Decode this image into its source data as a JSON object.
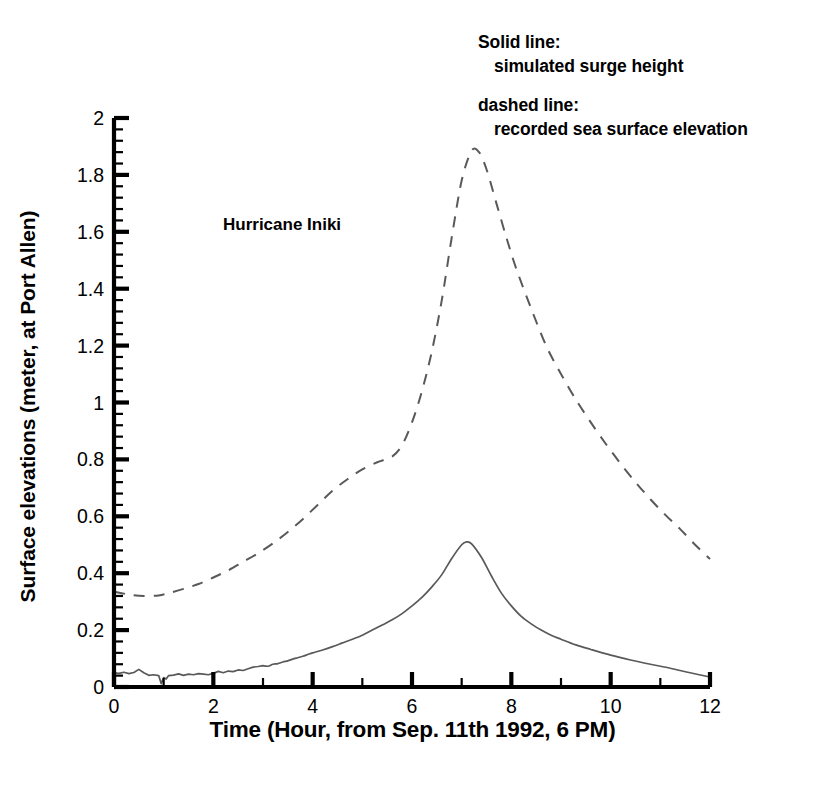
{
  "figure": {
    "width": 825,
    "height": 789,
    "background": "#ffffff",
    "ink_color": "#000000",
    "curve_color": "#59595b"
  },
  "annotations": {
    "solid_legend_line1": "Solid line:",
    "solid_legend_line2": "simulated surge height",
    "dashed_legend_line1": "dashed line:",
    "dashed_legend_line2": "recorded sea surface elevation",
    "storm_label": "Hurricane Iniki"
  },
  "axes": {
    "x_title": "Time (Hour, from Sep. 11th 1992, 6 PM)",
    "y_title": "Surface elevations (meter, at Port Allen)",
    "x_ticks_major": [
      0,
      2,
      4,
      6,
      8,
      10,
      12
    ],
    "x_tick_labels": [
      "0",
      "2",
      "4",
      "6",
      "8",
      "10",
      "12"
    ],
    "x_ticks_minor": [
      1,
      3,
      5,
      7,
      9,
      11
    ],
    "y_ticks_major": [
      0,
      0.2,
      0.4,
      0.6,
      0.8,
      1,
      1.2,
      1.4,
      1.6,
      1.8,
      2
    ],
    "y_tick_labels": [
      "0",
      "0.2",
      "0.4",
      "0.6",
      "0.8",
      "1",
      "1.2",
      "1.4",
      "1.6",
      "1.8",
      "2"
    ],
    "y_minor_step": 0.04,
    "xlim": [
      0,
      12
    ],
    "ylim": [
      0,
      2
    ],
    "grid": false,
    "spines": [
      "left",
      "bottom"
    ]
  },
  "chart_data": {
    "type": "line",
    "title": "",
    "xlabel": "Time (Hour, from Sep. 11th 1992, 6 PM)",
    "ylabel": "Surface elevations (meter, at Port Allen)",
    "xlim": [
      0,
      12
    ],
    "ylim": [
      0,
      2
    ],
    "grid": false,
    "legend_position": "annotation-top-right",
    "annotations": [
      "Hurricane Iniki",
      "Solid line: simulated surge height",
      "dashed line: recorded sea surface elevation"
    ],
    "series": [
      {
        "name": "simulated surge height",
        "style": "solid",
        "peak": {
          "x": 7.1,
          "y": 0.51
        },
        "x": [
          0.0,
          0.1,
          0.2,
          0.3,
          0.4,
          0.5,
          0.6,
          0.7,
          0.8,
          0.9,
          0.95,
          1.0,
          1.05,
          1.1,
          1.2,
          1.3,
          1.4,
          1.5,
          1.6,
          1.7,
          1.8,
          1.9,
          2.0,
          2.1,
          2.2,
          2.3,
          2.4,
          2.5,
          2.6,
          2.7,
          2.8,
          2.9,
          3.0,
          3.1,
          3.2,
          3.3,
          3.4,
          3.5,
          3.6,
          3.7,
          3.8,
          3.9,
          4.0,
          4.2,
          4.4,
          4.6,
          4.8,
          5.0,
          5.2,
          5.4,
          5.6,
          5.8,
          6.0,
          6.2,
          6.4,
          6.6,
          6.8,
          7.0,
          7.1,
          7.2,
          7.4,
          7.6,
          7.8,
          8.0,
          8.2,
          8.4,
          8.6,
          8.8,
          9.0,
          9.3,
          9.6,
          10.0,
          10.4,
          10.8,
          11.2,
          11.6,
          12.0
        ],
        "y": [
          0.05,
          0.048,
          0.052,
          0.047,
          0.051,
          0.062,
          0.05,
          0.041,
          0.043,
          0.04,
          0.012,
          0.033,
          0.028,
          0.04,
          0.042,
          0.046,
          0.041,
          0.045,
          0.043,
          0.047,
          0.045,
          0.043,
          0.048,
          0.055,
          0.05,
          0.056,
          0.054,
          0.06,
          0.058,
          0.064,
          0.07,
          0.072,
          0.075,
          0.073,
          0.08,
          0.082,
          0.088,
          0.092,
          0.098,
          0.103,
          0.108,
          0.114,
          0.12,
          0.13,
          0.142,
          0.155,
          0.168,
          0.182,
          0.2,
          0.218,
          0.236,
          0.258,
          0.285,
          0.315,
          0.352,
          0.395,
          0.452,
          0.5,
          0.51,
          0.503,
          0.455,
          0.39,
          0.33,
          0.285,
          0.248,
          0.222,
          0.2,
          0.182,
          0.168,
          0.148,
          0.132,
          0.112,
          0.095,
          0.08,
          0.066,
          0.05,
          0.035
        ]
      },
      {
        "name": "recorded sea surface elevation",
        "style": "dashed",
        "peak": {
          "x": 7.2,
          "y": 1.89
        },
        "x": [
          0.0,
          0.3,
          0.6,
          0.9,
          1.1,
          1.4,
          1.7,
          2.0,
          2.3,
          2.6,
          2.9,
          3.2,
          3.5,
          3.8,
          4.1,
          4.4,
          4.7,
          5.0,
          5.3,
          5.6,
          5.8,
          6.0,
          6.2,
          6.4,
          6.6,
          6.8,
          7.0,
          7.2,
          7.35,
          7.5,
          7.7,
          7.9,
          8.1,
          8.4,
          8.7,
          9.0,
          9.3,
          9.6,
          9.9,
          10.2,
          10.5,
          10.8,
          11.1,
          11.4,
          11.7,
          12.0
        ],
        "y": [
          0.335,
          0.325,
          0.32,
          0.322,
          0.33,
          0.345,
          0.362,
          0.385,
          0.41,
          0.44,
          0.47,
          0.505,
          0.545,
          0.59,
          0.64,
          0.69,
          0.73,
          0.765,
          0.79,
          0.81,
          0.85,
          0.93,
          1.04,
          1.18,
          1.36,
          1.58,
          1.78,
          1.885,
          1.88,
          1.82,
          1.7,
          1.58,
          1.47,
          1.33,
          1.2,
          1.1,
          1.01,
          0.93,
          0.855,
          0.785,
          0.72,
          0.66,
          0.605,
          0.555,
          0.5,
          0.45
        ]
      }
    ]
  }
}
